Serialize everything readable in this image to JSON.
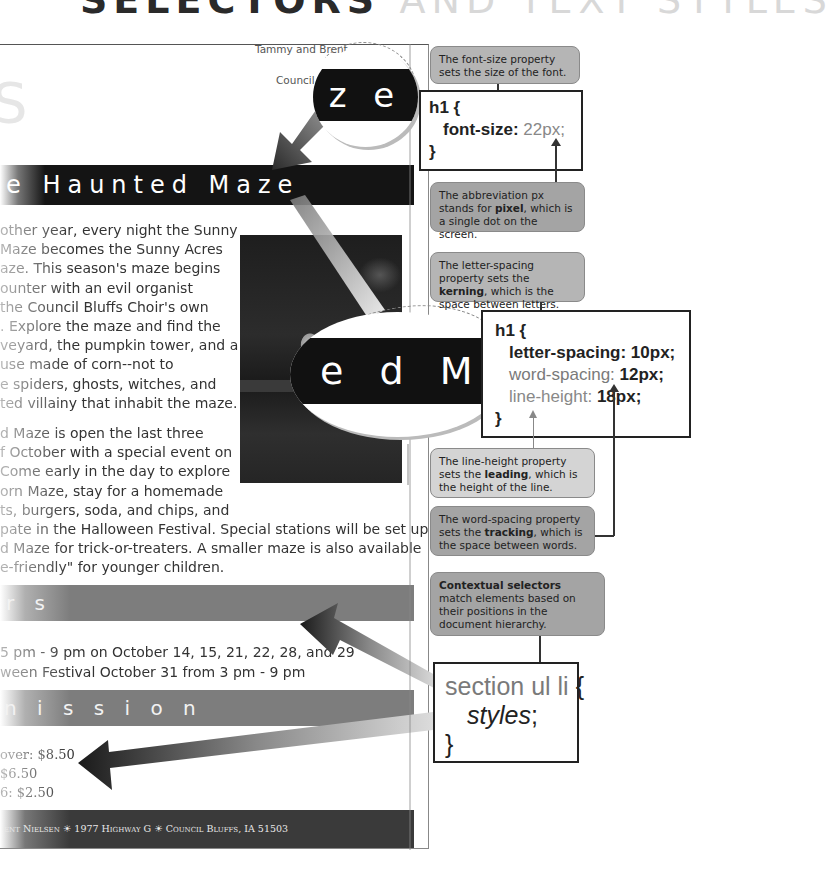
{
  "page_title": {
    "bold": "SELECTORS",
    "light": "AND TEXT STYLES"
  },
  "ghost_glyph": "S",
  "document": {
    "owner_line1": "Tammy and Brent",
    "owner_line2": "Council Bluffs",
    "main_banner": "e Haunted Maze",
    "paragraph1": [
      "other year, every night the Sunny",
      " Maze becomes the Sunny Acres",
      "aze. This season's maze begins",
      "ounter with an evil organist",
      "the Council Bluffs Choir's own",
      ". Explore the maze and find the",
      "veyard, the pumpkin tower, and a",
      "use made of corn--not to",
      "e spiders, ghosts, witches, and",
      "ted villainy that inhabit the maze."
    ],
    "paragraph2": [
      "d Maze is open the last three",
      "f October with a special event on",
      "Come early in the day to explore",
      "orn Maze, stay for a homemade",
      "ts, burgers, soda, and chips, and",
      "pate in the Halloween Festival. Special stations will be set up in",
      "d Maze for trick-or-treaters. A smaller maze is also available",
      "e-friendly\" for younger children."
    ],
    "hours_heading": "r s",
    "hours": [
      "5 pm - 9 pm on October 14, 15, 21, 22, 28, and 29",
      "ween Festival October 31 from 3 pm - 9 pm"
    ],
    "admission_heading": "n i s s i o n",
    "admission": [
      "over: $8.50",
      "$6.50",
      "6: $2.50"
    ],
    "footer": "ent Nielsen ☀ 1977 Highway G ☀ Council Bluffs, IA   51503"
  },
  "magnifiers": {
    "top": "z e",
    "middle": "e d  M a"
  },
  "callouts": {
    "font_size": "The font-size property sets the size of the font.",
    "pixel": {
      "pre": "The abbreviation px stands for ",
      "bold": "pixel",
      "post": ", which is a single dot on the screen."
    },
    "kerning": {
      "pre": "The letter-spacing property sets the ",
      "bold": "kerning",
      "post": ", which is the space between letters."
    },
    "leading": {
      "pre": "The line-height property sets the ",
      "bold": "leading",
      "post": ", which is the height of the line."
    },
    "tracking": {
      "pre": "The word-spacing property sets the ",
      "bold": "tracking",
      "post": ", which is the space between words."
    },
    "contextual": {
      "bold": "Contextual selectors",
      "post": " match elements based on their positions in the document hierarchy."
    }
  },
  "code": {
    "block1": {
      "selector": "h1 {",
      "prop": "font-size:",
      "value": " 22px;",
      "close": "}"
    },
    "block2": {
      "selector": "h1 {",
      "lines": [
        {
          "prop": "letter-spacing:",
          "value": " 10px;"
        },
        {
          "prop": "word-spacing:",
          "value": " 12px;"
        },
        {
          "prop": "line-height:",
          "value": " 18px;"
        }
      ],
      "close": "}"
    },
    "block3": {
      "selector": "section ul li ",
      "brace": "{",
      "body": "styles",
      "semi": ";",
      "close": "}"
    }
  },
  "colors": {
    "banner_dark": "#141414",
    "section_gray": "#7d7d7d",
    "callout_light": "#d4d4d4",
    "callout_mid": "#b5b5b5",
    "callout_dark": "#a4a4a4"
  }
}
